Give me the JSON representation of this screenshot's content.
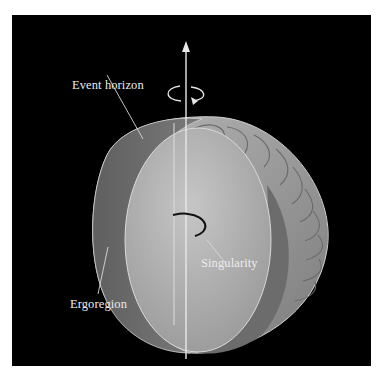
{
  "figure": {
    "background_color": "#000000",
    "surface_colors": {
      "ergoregion_outer": "#9a9a9a",
      "ergoregion_cut": "#6e6e6e",
      "event_horizon": "#b4b4b4",
      "axis": "#e6e6e6",
      "singularity_ring": "#111111"
    },
    "labels": {
      "event_horizon": "Event horizon",
      "singularity": "Singularity",
      "ergoregion": "Ergoregion"
    },
    "icons": [
      "rotation-axis-arrow",
      "rotation-direction-icon"
    ]
  }
}
